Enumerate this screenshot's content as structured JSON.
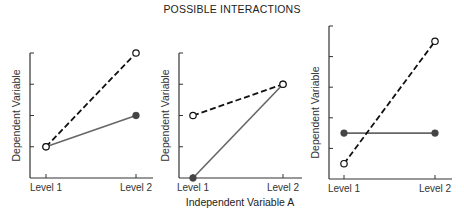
{
  "title": "POSSIBLE INTERACTIONS",
  "x_axis_title": "Independent Variable A",
  "colors": {
    "dashed_series": "#111111",
    "solid_series": "#666666",
    "axis": "#333333"
  },
  "chart_data": [
    {
      "type": "line",
      "title": "POSSIBLE INTERACTIONS (panel 1)",
      "categories": [
        "Level 1",
        "Level 2"
      ],
      "xlabel": "",
      "ylabel": "Dependent Variable",
      "ylim": [
        0,
        4
      ],
      "yticks": [
        1,
        2,
        3,
        4
      ],
      "grid": false,
      "series": [
        {
          "name": "dashed (open circles)",
          "style": "dashed",
          "marker": "open-circle",
          "values": [
            1,
            4
          ]
        },
        {
          "name": "solid (filled circles)",
          "style": "solid",
          "marker": "filled-circle",
          "values": [
            1,
            2
          ]
        }
      ]
    },
    {
      "type": "line",
      "title": "POSSIBLE INTERACTIONS (panel 2)",
      "categories": [
        "Level 1",
        "Level 2"
      ],
      "xlabel": "Independent Variable A",
      "ylabel": "Dependent Variable",
      "ylim": [
        0,
        4
      ],
      "yticks": [
        1,
        2,
        3,
        4
      ],
      "grid": false,
      "series": [
        {
          "name": "dashed (open circles)",
          "style": "dashed",
          "marker": "open-circle",
          "values": [
            2,
            3
          ]
        },
        {
          "name": "solid (filled circles)",
          "style": "solid",
          "marker": "filled-circle",
          "values": [
            0,
            3
          ]
        }
      ]
    },
    {
      "type": "line",
      "title": "POSSIBLE INTERACTIONS (panel 3)",
      "categories": [
        "Level 1",
        "Level 2"
      ],
      "xlabel": "",
      "ylabel": "Dependent Variable",
      "ylim": [
        0,
        5
      ],
      "yticks": [
        1,
        2,
        3,
        4,
        5
      ],
      "grid": false,
      "series": [
        {
          "name": "dashed (open circles)",
          "style": "dashed",
          "marker": "open-circle",
          "values": [
            0.5,
            4.5
          ]
        },
        {
          "name": "solid (filled circles)",
          "style": "solid",
          "marker": "filled-circle",
          "values": [
            1.5,
            1.5
          ]
        }
      ]
    }
  ]
}
